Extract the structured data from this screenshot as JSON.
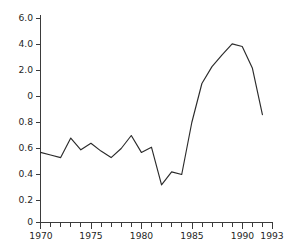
{
  "chart_data": {
    "type": "line",
    "title": "",
    "subtitle": "",
    "xlabel": "",
    "ylabel": "",
    "grid": false,
    "legend": "none",
    "axis_note": "y-axis uses a broken/segmented scale: lower segment 0-0.8 then upper segment 0-6.0",
    "y_ticks": [
      "6.0",
      "4.0",
      "2.0",
      "0",
      "0.8",
      "0.6",
      "0.4",
      "0.2",
      "0"
    ],
    "y_tick_values": [
      6.0,
      4.0,
      2.0,
      0,
      0.8,
      0.6,
      0.4,
      0.2,
      0
    ],
    "x_ticks": [
      "1970",
      "1975",
      "1980",
      "1985",
      "1990",
      "1993"
    ],
    "x_tick_values": [
      1970,
      1975,
      1980,
      1985,
      1990,
      1993
    ],
    "xlim": [
      1970,
      1993
    ],
    "ylim": [
      0,
      6.0
    ],
    "x": [
      1970,
      1971,
      1972,
      1973,
      1974,
      1975,
      1976,
      1977,
      1978,
      1979,
      1980,
      1981,
      1982,
      1983,
      1984,
      1985,
      1986,
      1987,
      1988,
      1989,
      1990,
      1991,
      1992
    ],
    "values": [
      0.57,
      0.55,
      0.53,
      0.68,
      0.59,
      0.64,
      0.58,
      0.53,
      0.6,
      0.7,
      0.57,
      0.61,
      0.32,
      0.42,
      0.4,
      0.8,
      1.5,
      2.3,
      3.2,
      4.05,
      3.85,
      2.2,
      0.86
    ],
    "series": [
      {
        "name": "series-1",
        "values": [
          0.57,
          0.55,
          0.53,
          0.68,
          0.59,
          0.64,
          0.58,
          0.53,
          0.6,
          0.7,
          0.57,
          0.61,
          0.32,
          0.42,
          0.4,
          0.8,
          1.5,
          2.3,
          3.2,
          4.05,
          3.85,
          2.2,
          0.86
        ]
      }
    ],
    "colors": {
      "line": "#2b2b2b",
      "axis": "#3b3b3b",
      "text": "#1f1f1f",
      "background": "#ffffff"
    }
  }
}
